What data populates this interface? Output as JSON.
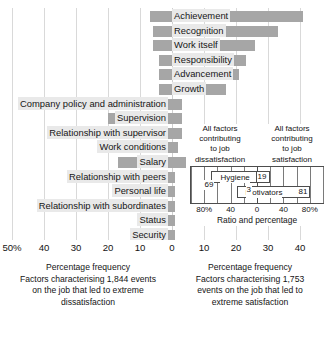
{
  "chart_data": {
    "type": "bar",
    "title": "",
    "xlabel": "Percentage frequency",
    "ylabel": "",
    "orientation": "horizontal-diverging",
    "grid": true,
    "xlim": [
      -50,
      45
    ],
    "axis_ticks": [
      {
        "label": "50%",
        "value": -50
      },
      {
        "label": "40",
        "value": -40
      },
      {
        "label": "30",
        "value": -30
      },
      {
        "label": "20",
        "value": -20
      },
      {
        "label": "10",
        "value": -10
      },
      {
        "label": "0",
        "value": 0
      },
      {
        "label": "10",
        "value": 10
      },
      {
        "label": "20",
        "value": 20
      },
      {
        "label": "30",
        "value": 30
      },
      {
        "label": "40",
        "value": 40
      }
    ],
    "categories": [
      "Achievement",
      "Recognition",
      "Work itself",
      "Responsibility",
      "Advancement",
      "Growth",
      "Company policy and administration",
      "Supervision",
      "Relationship with supervisor",
      "Work conditions",
      "Salary",
      "Relationship with peers",
      "Personal life",
      "Relationship with subordinates",
      "Status",
      "Security"
    ],
    "series": [
      {
        "name": "Extreme satisfaction (right)",
        "values": [
          41,
          33,
          26,
          23,
          21,
          17,
          0,
          0,
          0,
          0,
          0,
          0,
          0,
          0,
          0,
          0
        ]
      },
      {
        "name": "Extreme dissatisfaction (left)",
        "values": [
          7,
          6,
          6,
          6,
          4,
          3,
          31,
          20,
          15,
          11,
          17,
          8,
          6,
          6,
          4,
          2
        ]
      }
    ],
    "rows": [
      {
        "label": "Achievement",
        "side": "right",
        "right": 41,
        "left": 7
      },
      {
        "label": "Recognition",
        "side": "right",
        "right": 33,
        "left": 6
      },
      {
        "label": "Work itself",
        "side": "right",
        "right": 26,
        "left": 6
      },
      {
        "label": "Responsibility",
        "side": "right",
        "right": 23,
        "left": 4
      },
      {
        "label": "Advancement",
        "side": "right",
        "right": 21,
        "left": 4
      },
      {
        "label": "Growth",
        "side": "right",
        "right": 17,
        "left": 4
      },
      {
        "label": "Company policy and administration",
        "side": "left",
        "right": 3,
        "left": 31
      },
      {
        "label": "Supervision",
        "side": "left",
        "right": 3,
        "left": 20
      },
      {
        "label": "Relationship with supervisor",
        "side": "left",
        "right": 3,
        "left": 15
      },
      {
        "label": "Work conditions",
        "side": "left",
        "right": 2,
        "left": 11
      },
      {
        "label": "Salary",
        "side": "left",
        "right": 5,
        "left": 17
      },
      {
        "label": "Relationship with peers",
        "side": "left",
        "right": 1,
        "left": 8
      },
      {
        "label": "Personal life",
        "side": "left",
        "right": 1,
        "left": 6
      },
      {
        "label": "Relationship with subordinates",
        "side": "left",
        "right": 1,
        "left": 6
      },
      {
        "label": "Status",
        "side": "left",
        "right": 1,
        "left": 4
      },
      {
        "label": "Security",
        "side": "left",
        "right": 1,
        "left": 2
      }
    ],
    "bar_color": "#a6a6a6",
    "label_bg": "#e9e9e9",
    "grid_color": "#d9d9d9",
    "inset": {
      "type": "bar",
      "heading_left": [
        "All factors",
        "contributing",
        "to job",
        "dissatisfaction"
      ],
      "heading_right": [
        "All factors",
        "contributing",
        "to job",
        "satisfaction"
      ],
      "xlabel": "Ratio and  percentage",
      "axis_ticks": [
        {
          "label": "80%",
          "value": -80
        },
        {
          "label": "40",
          "value": -40
        },
        {
          "label": "0",
          "value": 0
        },
        {
          "label": "40",
          "value": 40
        },
        {
          "label": "80%",
          "value": 80
        }
      ],
      "xlim": [
        -100,
        100
      ],
      "bars": [
        {
          "name": "Hygiene",
          "left": 69,
          "right": 19,
          "left_value": "69",
          "right_value": "19"
        },
        {
          "name": "Motivators",
          "left": 31,
          "right": 81,
          "left_value": "3",
          "right_value": "81"
        }
      ],
      "value_labels": {
        "hygiene_left": "69",
        "hygiene_right": "19",
        "motivators_left": "3",
        "motivators_right": "81"
      }
    }
  },
  "captions": {
    "left": {
      "line1": "Percentage frequency",
      "line2": "Factors characterising 1,844 events",
      "line3": "on the job that led to extreme",
      "line4": "dissatisfaction"
    },
    "right": {
      "line1": "Percentage frequency",
      "line2": "Factors characterising 1,753",
      "line3": "events on the job that led to",
      "line4": "extreme satisfaction"
    }
  }
}
